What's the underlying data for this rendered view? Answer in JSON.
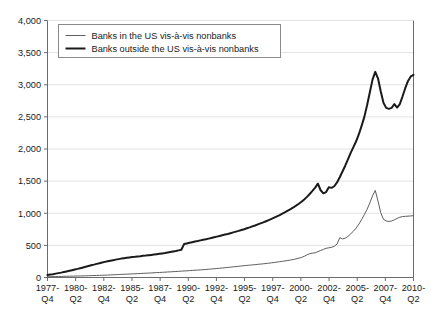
{
  "chart_data": {
    "type": "line",
    "title": "",
    "subtitle": "",
    "xlabel": "",
    "ylabel": "",
    "ylim": [
      0,
      4000
    ],
    "yticks": [
      0,
      500,
      1000,
      1500,
      2000,
      2500,
      3000,
      3500,
      4000
    ],
    "ytick_labels": [
      "0",
      "500",
      "1,000",
      "1,500",
      "2,000",
      "2,500",
      "3,000",
      "3,500",
      "4,000"
    ],
    "grid": "horizontal",
    "legend_position": "top-left",
    "x_tick_labels": [
      {
        "year": "1977-",
        "quarter": "Q4"
      },
      {
        "year": "1980-",
        "quarter": "Q2"
      },
      {
        "year": "1982-",
        "quarter": "Q4"
      },
      {
        "year": "1985-",
        "quarter": "Q2"
      },
      {
        "year": "1987-",
        "quarter": "Q4"
      },
      {
        "year": "1990-",
        "quarter": "Q2"
      },
      {
        "year": "1992-",
        "quarter": "Q4"
      },
      {
        "year": "1995-",
        "quarter": "Q2"
      },
      {
        "year": "1997-",
        "quarter": "Q4"
      },
      {
        "year": "2000-",
        "quarter": "Q2"
      },
      {
        "year": "2002-",
        "quarter": "Q4"
      },
      {
        "year": "2005-",
        "quarter": "Q2"
      },
      {
        "year": "2007-",
        "quarter": "Q4"
      },
      {
        "year": "2010-",
        "quarter": "Q2"
      }
    ],
    "x_index_range": [
      0,
      130
    ],
    "series": [
      {
        "name": "Banks in the US vis-à-vis nonbanks",
        "color": "#4d4d4d",
        "line_width": 0.9,
        "values": [
          12,
          13,
          14,
          15,
          16,
          17,
          18,
          19,
          20,
          21,
          22,
          23,
          24,
          25,
          26,
          28,
          29,
          30,
          32,
          33,
          35,
          36,
          38,
          40,
          42,
          44,
          46,
          48,
          50,
          52,
          54,
          56,
          58,
          60,
          62,
          65,
          67,
          69,
          71,
          74,
          76,
          78,
          81,
          83,
          86,
          88,
          91,
          93,
          96,
          99,
          102,
          104,
          107,
          110,
          113,
          116,
          119,
          122,
          125,
          129,
          132,
          136,
          140,
          144,
          148,
          152,
          157,
          161,
          166,
          170,
          175,
          180,
          184,
          188,
          192,
          196,
          200,
          205,
          209,
          213,
          218,
          223,
          228,
          234,
          240,
          246,
          252,
          258,
          265,
          272,
          280,
          290,
          300,
          312,
          330,
          352,
          371,
          378,
          386,
          402,
          420,
          437,
          455,
          462,
          470,
          486,
          520,
          620,
          600,
          612,
          640,
          680,
          720,
          770,
          830,
          900,
          980,
          1060,
          1160,
          1270,
          1355,
          1190,
          1010,
          905,
          880,
          872,
          880,
          898,
          920,
          938,
          948,
          952,
          955,
          958,
          962
        ]
      },
      {
        "name": "Banks outside the US vis-à-vis nonbanks",
        "color": "#1a1a1a",
        "line_width": 2.0,
        "values": [
          38,
          45,
          52,
          60,
          68,
          76,
          85,
          94,
          104,
          114,
          124,
          134,
          145,
          156,
          167,
          178,
          190,
          200,
          212,
          222,
          233,
          243,
          252,
          262,
          270,
          278,
          286,
          294,
          300,
          306,
          312,
          318,
          322,
          328,
          332,
          338,
          342,
          348,
          352,
          357,
          362,
          368,
          374,
          380,
          388,
          396,
          404,
          412,
          422,
          432,
          520,
          530,
          540,
          550,
          560,
          568,
          578,
          588,
          596,
          605,
          615,
          625,
          636,
          646,
          658,
          668,
          678,
          690,
          702,
          714,
          726,
          740,
          752,
          766,
          780,
          796,
          810,
          826,
          842,
          858,
          876,
          894,
          912,
          932,
          952,
          972,
          994,
          1016,
          1040,
          1064,
          1090,
          1118,
          1148,
          1180,
          1215,
          1255,
          1300,
          1348,
          1400,
          1460,
          1358,
          1310,
          1330,
          1405,
          1395,
          1420,
          1480,
          1560,
          1650,
          1740,
          1840,
          1940,
          2030,
          2120,
          2230,
          2360,
          2500,
          2680,
          2880,
          3080,
          3200,
          3100,
          2900,
          2720,
          2640,
          2625,
          2640,
          2700,
          2645,
          2700,
          2820,
          2950,
          3060,
          3130,
          3155
        ]
      }
    ]
  },
  "legend": {
    "items": [
      {
        "label": "Banks in the US vis-à-vis nonbanks",
        "swatch": "thin-line-swatch"
      },
      {
        "label": "Banks outside the US vis-à-vis nonbanks",
        "swatch": "thick-line-swatch"
      }
    ]
  },
  "colors": {
    "background": "#ffffff",
    "axis": "#6b6b6b",
    "grid": "#e2e2e2",
    "text": "#1a1a1a",
    "series_thin": "#4d4d4d",
    "series_thick": "#1a1a1a"
  }
}
